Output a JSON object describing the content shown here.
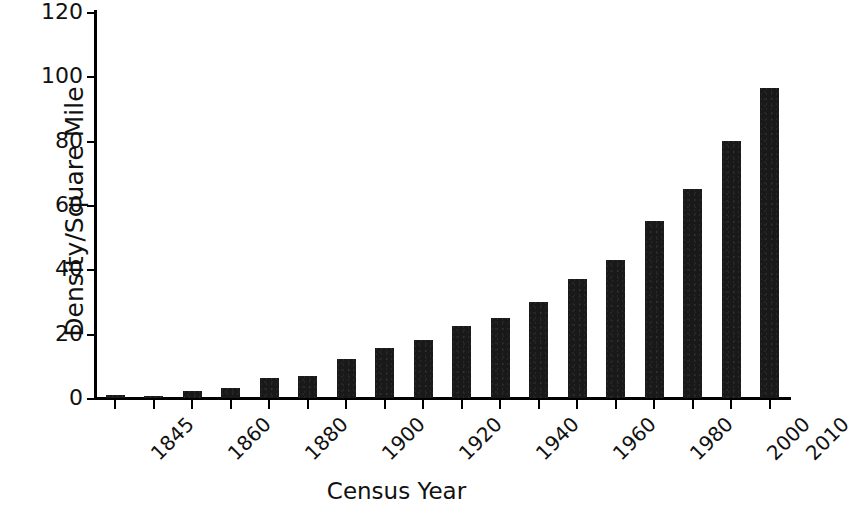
{
  "chart_data": {
    "type": "bar",
    "title": "",
    "xlabel": "Census Year",
    "ylabel": "Density/Square Mile",
    "ylim": [
      0,
      120
    ],
    "y_ticks": [
      0,
      20,
      40,
      60,
      80,
      100,
      120
    ],
    "grid": false,
    "legend": "none",
    "bar_color": "#191919",
    "categories": [
      "1845",
      "1850",
      "1860",
      "1870",
      "1880",
      "1890",
      "1900",
      "1910",
      "1920",
      "1930",
      "1940",
      "1950",
      "1960",
      "1970",
      "1980",
      "1990",
      "2000",
      "2010"
    ],
    "tick_labels_shown": [
      "1845",
      "",
      "1860",
      "",
      "1880",
      "",
      "1900",
      "",
      "1920",
      "",
      "1940",
      "",
      "1960",
      "",
      "1980",
      "",
      "2000",
      "2010"
    ],
    "values": [
      1.0,
      0.7,
      2.3,
      3.0,
      6.3,
      6.7,
      12.0,
      15.5,
      18.0,
      22.5,
      24.8,
      30.0,
      37.0,
      43.0,
      55.0,
      65.0,
      80.0,
      91.0
    ],
    "values_note_last": 96.5
  },
  "axis": {
    "y_title": "Density/Square Mile",
    "x_title": "Census Year",
    "y_tick_labels": [
      "0",
      "20",
      "40",
      "60",
      "80",
      "100",
      "120"
    ]
  }
}
